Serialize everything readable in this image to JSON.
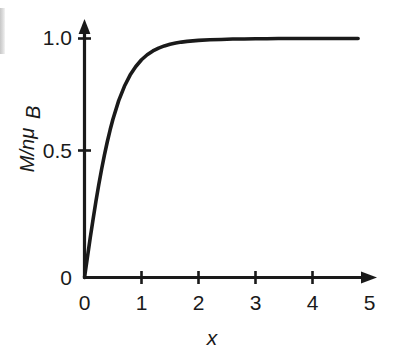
{
  "chart_data": {
    "type": "line",
    "title": "",
    "subtitle": "",
    "xlabel": "x",
    "ylabel": "M/nμ",
    "ylabel_sub": "B",
    "ylabel_numerator": "M",
    "ylabel_denominator": "nμ",
    "xlim": [
      0,
      5
    ],
    "ylim": [
      0,
      1.08
    ],
    "grid": false,
    "legend": null,
    "series": [
      {
        "name": "Langevin magnetization L(x) = coth(x) - 1/x",
        "x": [
          0.0,
          0.05,
          0.1,
          0.15,
          0.2,
          0.25,
          0.3,
          0.35,
          0.4,
          0.45,
          0.5,
          0.6,
          0.7,
          0.8,
          0.9,
          1.0,
          1.1,
          1.2,
          1.3,
          1.4,
          1.5,
          1.6,
          1.7,
          1.8,
          1.9,
          2.0,
          2.2,
          2.4,
          2.6,
          2.8,
          3.0,
          3.2,
          3.4,
          3.6,
          3.8,
          4.0,
          4.2,
          4.4,
          4.6,
          4.8
        ],
        "y": [
          0.0,
          0.083,
          0.165,
          0.243,
          0.318,
          0.388,
          0.453,
          0.513,
          0.568,
          0.618,
          0.663,
          0.74,
          0.8,
          0.847,
          0.883,
          0.911,
          0.932,
          0.948,
          0.96,
          0.969,
          0.976,
          0.981,
          0.985,
          0.988,
          0.99,
          0.992,
          0.995,
          0.996,
          0.998,
          0.998,
          0.999,
          0.999,
          1.0,
          1.0,
          1.0,
          1.0,
          1.0,
          1.0,
          1.0,
          1.0
        ]
      }
    ],
    "x_ticks": [
      {
        "value": 0,
        "label": "0"
      },
      {
        "value": 1,
        "label": "1"
      },
      {
        "value": 2,
        "label": "2"
      },
      {
        "value": 3,
        "label": "3"
      },
      {
        "value": 4,
        "label": "4"
      },
      {
        "value": 5,
        "label": "5"
      }
    ],
    "y_ticks": [
      {
        "value": 0,
        "label": "0"
      },
      {
        "value": 0.5,
        "label": "0.5"
      },
      {
        "value": 1.0,
        "label": "1.0"
      }
    ],
    "colors": {
      "curve": "#1a1a1a",
      "axis": "#1a1a1a",
      "background": "#ffffff",
      "text": "#1a1a1a"
    },
    "axis_style": "arrow-tipped",
    "annotations": []
  }
}
